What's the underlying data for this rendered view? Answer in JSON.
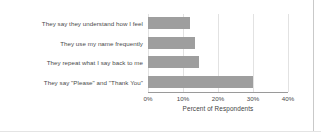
{
  "chart_data": {
    "type": "bar",
    "orientation": "horizontal",
    "title": "",
    "xlabel": "Percent of Respondents",
    "ylabel": "",
    "categories": [
      "They say they understand how I feel",
      "They use my name frequently",
      "They repeat what I say back to me",
      "They say \"Please\" and \"Thank You\""
    ],
    "values": [
      12,
      13.5,
      14.5,
      30
    ],
    "xlim": [
      0,
      40
    ],
    "xticks": [
      0,
      10,
      20,
      30,
      40
    ],
    "xtick_labels": [
      "0%",
      "10%",
      "20%",
      "30%",
      "40%"
    ],
    "grid": "vertical",
    "legend": "none",
    "bar_color": "#9e9e9e",
    "axis_color": "#9a9a9a",
    "gridline_color": "#e2e2e2",
    "text_color": "#4a4a4a"
  }
}
